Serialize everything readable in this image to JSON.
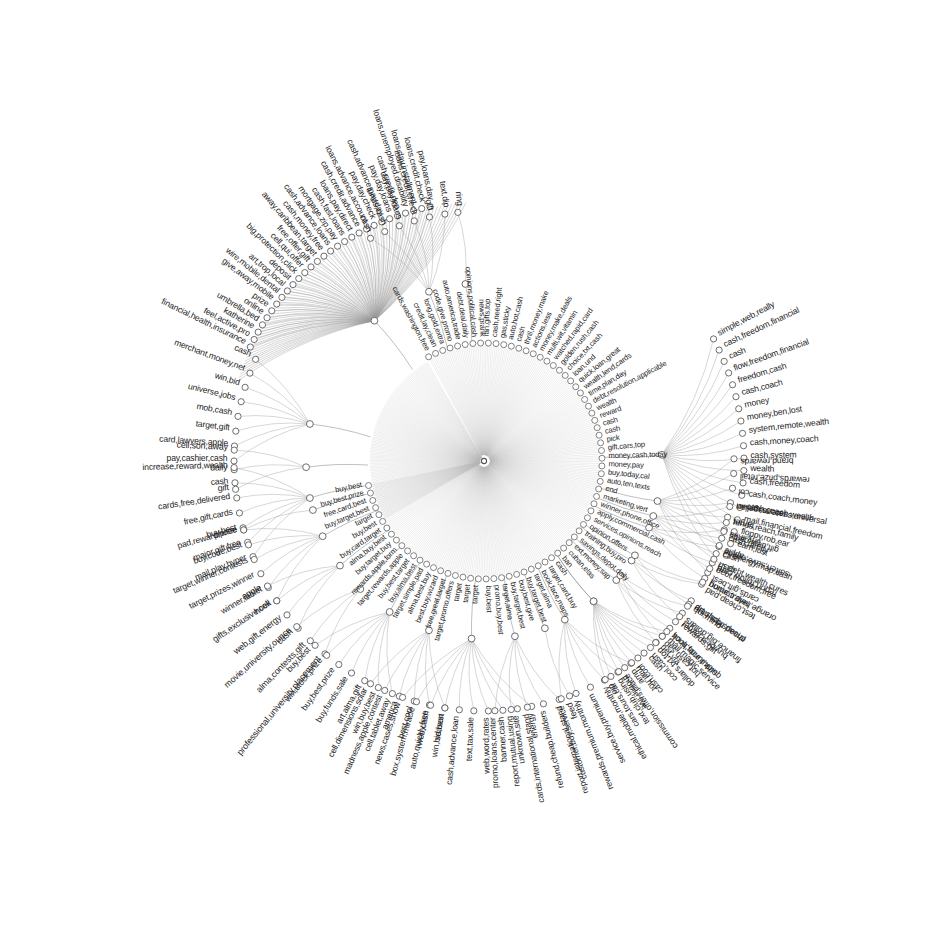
{
  "figure": {
    "type": "radial-dendrogram",
    "center": {
      "x": 484,
      "y": 461
    },
    "colors": {
      "background": "#ffffff",
      "edge": "#9a9a9a",
      "node_stroke": "#5e5e5e",
      "node_fill": "#ffffff",
      "text": "#1d1d1d"
    }
  },
  "chart_data": {
    "type": "tree",
    "layout": "radial",
    "root_label": "",
    "n_rings": 3,
    "rings": [
      {
        "name": "inner-ring",
        "radius": 118,
        "note": "dense fan of leaves attached directly to hub"
      },
      {
        "name": "mid-ring",
        "radius": 175,
        "note": "intermediate cluster nodes"
      },
      {
        "name": "outer-ring",
        "radius": 255,
        "note": "outer leaf fans"
      }
    ],
    "inner_ring_labels": [
      "cards,washington,free",
      "credit,lay,clean",
      "long,gold,extra",
      "code,give,promo",
      "auto,america,trade",
      "debt,deal,daily",
      "opinions,political,cash",
      "news,prank",
      "ran,gifts,top",
      "cash,need,right",
      "gas,sticky",
      "auto,hot,cash",
      "cash",
      "thrill,money,make",
      "actions,less",
      "money,make,deals",
      "multi,wit,vitamin",
      "watched,rapid,card",
      "golden,rush,cash",
      "choice,txt,cash",
      "loan,und",
      "quick,loan,great",
      "wealth,lend,cards",
      "time,plan,day",
      "debt,resolution,applicable",
      "wealth",
      "reward",
      "cash",
      "cash",
      "pick",
      "gift,cars,top",
      "money,cash,today",
      "money,pay",
      "buy,today,cal",
      "auto,ten,texts",
      "end",
      "marketing,vert",
      "winner,phone,office",
      "apply,commercial,cash",
      "services,opinions,reach",
      "opinion,offers",
      "training,buy,pro",
      "savings,depot,daily",
      "ext,money,sap",
      "cuban,elas",
      "ban",
      "cash",
      "target,card,buy",
      "book,face,maps",
      "target,alma",
      "buy,target,best",
      "buy,best,give",
      "buy,target,best",
      "target,alma",
      "promo,buy,best",
      "buy,best",
      "target",
      "target",
      "target",
      "target,promo,offers",
      "free,great,target",
      "best,buy,wizard",
      "alma,best,buy",
      "target,simple,pad",
      "buy,alma,best",
      "buy,best,target",
      "target,rewards,apple",
      "rewards,apple,form",
      "buy,target,buy",
      "alma,buy,best",
      "buy,card,target",
      "buy,best",
      "target",
      "buy,target,best",
      "free,card,best",
      "buy,best,prize",
      "buy,best"
    ],
    "clusters": [
      {
        "id": "c-top-credit",
        "angle_deg": -108,
        "label_hint": "payday loan cluster",
        "leaves": [
          "cash",
          "funds,cash",
          "day,pay,loans",
          "loans,credit,check",
          "gift",
          "text,dip"
        ]
      },
      {
        "id": "c-topleft-insurance",
        "angle_deg": -128,
        "label_hint": "insurance / protection cluster",
        "leaves": [
          "financial,health,insurance",
          "feel,active,pro",
          "katherine",
          "umbrella,bed",
          "online",
          "prize",
          "give,away,mobile",
          "wire,mobile,dental",
          "art,trop,local",
          "deposit",
          "big,protection,click",
          "cell,qui,offer",
          "free,offer,gift",
          "away,caribbean,target",
          "cash,money,free",
          "cash,advance,loans",
          "mortgage,zip,pay",
          "cash,fast,loans",
          "loans,pay,direct",
          "cash,credit,advance",
          "loans,advance,account",
          "pay,day,check",
          "cash,advance,pay,day",
          "pay,day,loans",
          "cash,credit,dep",
          "loans,unemployed,disability",
          "loans,day,installment",
          "loans,credit,check",
          "pay,loans,day"
        ]
      },
      {
        "id": "c-left-merchant",
        "angle_deg": -168,
        "label_hint": "merchant / prize cluster",
        "leaves": [
          "pay,cashier,cash",
          "card,lawyers,apple",
          "target,gift",
          "mob,cash",
          "universe,jobs",
          "win,bid",
          "merchant,money,net",
          "cash"
        ]
      },
      {
        "id": "c-left-gift",
        "angle_deg": -182,
        "label_hint": "gift / daily",
        "leaves": [
          "gift",
          "daily",
          "cell,son,away"
        ]
      },
      {
        "id": "c-left-mail",
        "angle_deg": -192,
        "label_hint": "gift card mail cluster",
        "leaves": [
          "mail,play,hyper",
          "major,gift,free",
          "buy,best",
          "free,gift,cards",
          "cards,free,delivered",
          "cash",
          "increase,reward,wealth"
        ]
      },
      {
        "id": "c-left-winner",
        "angle_deg": -205,
        "label_hint": "contest / winner cluster",
        "leaves": [
          "hook",
          "winner,tablet",
          "target,prizes,winner",
          "target,winner,contests",
          "buy,code,best",
          "pad,reward,prize"
        ]
      },
      {
        "id": "c-left-web",
        "angle_deg": -216,
        "label_hint": "web gift energy",
        "leaves": [
          "cash",
          "web,gift,energy",
          "gifts,exclusive,cell",
          "apple"
        ]
      },
      {
        "id": "c-left-university",
        "angle_deg": -226,
        "label_hint": "university / placement",
        "leaves": [
          "professional,university,placement",
          "alma,contests,gift",
          "movie,university,ounce"
        ]
      },
      {
        "id": "c-bottomleft-buy",
        "angle_deg": -238,
        "label_hint": "buy / win cluster",
        "leaves": [
          "cell,tablet,away",
          "win,buy,best",
          "art,alma,gift",
          "buy,funds,sale",
          "buy,best,prize",
          "win,stock,prize",
          "buy,best"
        ]
      },
      {
        "id": "c-bottomleft-auto",
        "angle_deg": -252,
        "label_hint": "auto / contest cluster",
        "leaves": [
          "win,bid,best",
          "auto,quickly,free",
          "best,cool",
          "america",
          "madness,apple,contest",
          "cell,dimensions,solar"
        ]
      },
      {
        "id": "c-bottom-rates",
        "angle_deg": -266,
        "label_hint": "rates / tax / loan cluster",
        "leaves": [
          "energy",
          "unknown,site",
          "banner,cash",
          "web,word,rates",
          "text,tax,sale",
          "cash,advance,loan",
          "season",
          "web,cash",
          "box,system,miracle",
          "news,cases,show"
        ]
      },
      {
        "id": "c-bottom-report",
        "angle_deg": -280,
        "label_hint": "international / refund cluster",
        "leaves": [
          "report,international,stand",
          "refund,cheap,builders",
          "cards,international,stand",
          "report,mutual,using",
          "promo,loans,center"
        ]
      },
      {
        "id": "c-bottom-feed",
        "angle_deg": -290,
        "label_hint": "feed",
        "leaves": [
          "feed"
        ]
      },
      {
        "id": "c-bottom-rewards",
        "angle_deg": -297,
        "label_hint": "rewards / premium cluster",
        "leaves": [
          "amp",
          "text,club,using",
          "ethical,mobile,monthly",
          "service,buy,premium",
          "rewards,premium,monthly",
          "customer,buy,service"
        ]
      },
      {
        "id": "c-bottom-cash",
        "angle_deg": -308,
        "label_hint": "cash / commission cluster",
        "leaves": [
          "hot,cash,sap",
          "cool,cash",
          "cash,cool",
          "commission,offers,place",
          "cars,tours,car"
        ]
      },
      {
        "id": "c-bottom-finance",
        "angle_deg": -318,
        "label_hint": "finance / dollars cluster",
        "leaves": [
          "finance,big,dollars",
          "quick,funds,brick",
          "dollars,txt,top"
        ]
      },
      {
        "id": "c-bottom-test",
        "angle_deg": -326,
        "label_hint": "test / trips cluster",
        "leaves": [
          "test,cheap,pad",
          "cheap,trips,help",
          "buy,best,target"
        ]
      },
      {
        "id": "c-bottomright-tiny",
        "angle_deg": -338,
        "label_hint": "tiny links cluster",
        "leaves": [
          "tiny,links",
          "soften,save,online",
          "report,follow,card",
          "orange,help,coming"
        ]
      },
      {
        "id": "c-bottomright-brand",
        "angle_deg": -347,
        "label_hint": "brand rewards cluster",
        "leaves": [
          "brand,rewards",
          "rewards,prize,retail",
          "col",
          "rate,magellan",
          "target",
          "gift,deal,cards",
          "apple",
          "cash",
          "cards,gift,best"
        ]
      },
      {
        "id": "c-right-wealth",
        "angle_deg": -2,
        "label_hint": "wealth / freedom cluster",
        "leaves": [
          "simple,web,really",
          "cash,freedom,financial",
          "cash",
          "flow,freedom,financial",
          "freedom,cash",
          "cash,coach",
          "money",
          "money,ben,lost",
          "system,remote,wealth",
          "cash,money,coach",
          "cash,system",
          "wealth",
          "cash,freedom",
          "cash,coach,money",
          "cash,coach,wealth",
          "mail,financial,freedom",
          "floppy,rob,ear",
          "earn,lust",
          "energy,map,cash",
          "debt,wealth,cures"
        ]
      },
      {
        "id": "c-right-success",
        "angle_deg": 18,
        "label_hint": "wealth success cluster",
        "leaves": [
          "wealth,success,universal",
          "funds,reach,family",
          "cash,family",
          "cash",
          "debt,freedom,free"
        ]
      },
      {
        "id": "c-right-home",
        "angle_deg": 32,
        "label_hint": "home travel",
        "leaves": [
          "home,travel",
          "art,shop,special"
        ]
      },
      {
        "id": "c-right-magic",
        "angle_deg": 40,
        "label_hint": "magic service cluster",
        "leaves": [
          "qui,mind",
          "rewards,gift",
          "mail,magic,service"
        ]
      },
      {
        "id": "c-right-book",
        "angle_deg": 52,
        "label_hint": "book face maps cluster",
        "leaves": [
          "book,face,maps",
          "net,via",
          "cash",
          "mail,hot",
          "mobile,live",
          "dio"
        ]
      },
      {
        "id": "c-topright-ring",
        "angle_deg": -96,
        "label_hint": "ring",
        "leaves": [
          "ring"
        ]
      },
      {
        "id": "c-left-phone",
        "angle_deg": -196,
        "label_hint": "phone",
        "leaves": [
          "phone"
        ]
      }
    ],
    "standalone_labels": [
      "ring",
      "phone",
      "feed",
      "apple",
      "amp",
      "cash",
      "gift",
      "daily"
    ]
  }
}
